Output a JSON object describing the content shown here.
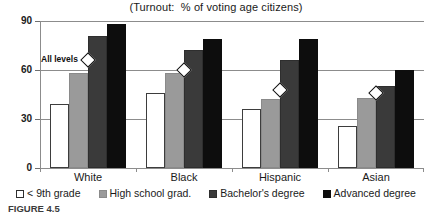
{
  "figure": {
    "caption": "FIGURE 4.5"
  },
  "chart_data": {
    "type": "bar",
    "title": "(Turnout:  % of voting age citizens)",
    "xlabel": "",
    "ylabel": "",
    "ylim": [
      0,
      90
    ],
    "yticks": [
      0,
      30,
      60,
      90
    ],
    "ytick_labels": [
      "0",
      "30",
      "60",
      "90"
    ],
    "grid": true,
    "legend_position": "bottom",
    "categories": [
      "White",
      "Black",
      "Hispanic",
      "Asian"
    ],
    "series": [
      {
        "name": "< 9th grade",
        "color": "#ffffff",
        "values": [
          39,
          46,
          36,
          26
        ]
      },
      {
        "name": "High school grad.",
        "color": "#9a9a9a",
        "values": [
          58,
          58,
          42,
          43
        ]
      },
      {
        "name": "Bachelor's degree",
        "color": "#3a3a3a",
        "values": [
          81,
          72,
          66,
          50
        ]
      },
      {
        "name": "Advanced degree",
        "color": "#0d0d0d",
        "values": [
          88,
          79,
          79,
          60
        ]
      }
    ],
    "overlay": {
      "name": "All levels",
      "marker": "diamond",
      "label": "All levels",
      "values": [
        66,
        60,
        48,
        46
      ]
    }
  }
}
